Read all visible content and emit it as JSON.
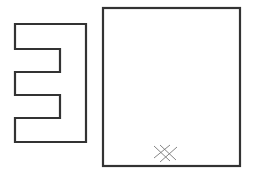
{
  "canvas": {
    "width": 255,
    "height": 181,
    "background": "#ffffff"
  },
  "colors": {
    "stroke": "#333333",
    "hatch": "#555555"
  },
  "shapes": {
    "e_shape": {
      "label": "mirrored E-shaped outline",
      "points": "15,24 86,24 86,142 15,142 15,118 60,118 60,95 15,95 15,72 60,72 60,49 15,49"
    },
    "rectangle": {
      "label": "rectangle outline",
      "x": 103,
      "y": 8,
      "width": 137,
      "height": 158
    },
    "hatch_mark": {
      "label": "cross-hatch mark",
      "lines": [
        {
          "x1": 154,
          "y1": 146,
          "x2": 170,
          "y2": 161
        },
        {
          "x1": 160,
          "y1": 145,
          "x2": 176,
          "y2": 160
        },
        {
          "x1": 154,
          "y1": 158,
          "x2": 170,
          "y2": 145
        },
        {
          "x1": 160,
          "y1": 162,
          "x2": 177,
          "y2": 147
        }
      ]
    }
  }
}
